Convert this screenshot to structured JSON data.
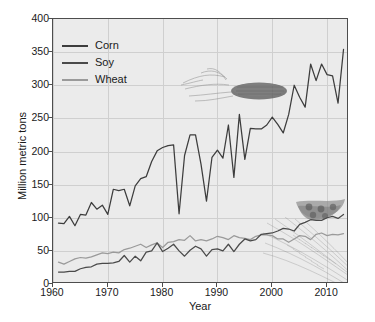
{
  "chart_data": {
    "type": "line",
    "title": "",
    "xlabel": "Year",
    "ylabel": "Million metric tons",
    "xlim": [
      1960,
      2014
    ],
    "ylim": [
      0,
      400
    ],
    "ytick_values": [
      0,
      50,
      100,
      150,
      200,
      250,
      300,
      350,
      400
    ],
    "ytick_labels": [
      "0",
      "50",
      "100",
      "150",
      "200",
      "250",
      "300",
      "350",
      "400"
    ],
    "xtick_values": [
      1960,
      1970,
      1980,
      1990,
      2000,
      2010
    ],
    "xtick_labels": [
      "1960",
      "1970",
      "1980",
      "1990",
      "2000",
      "2010"
    ],
    "grid": true,
    "legend_position": "top-left",
    "x": [
      1961,
      1962,
      1963,
      1964,
      1965,
      1966,
      1967,
      1968,
      1969,
      1970,
      1971,
      1972,
      1973,
      1974,
      1975,
      1976,
      1977,
      1978,
      1979,
      1980,
      1981,
      1982,
      1983,
      1984,
      1985,
      1986,
      1987,
      1988,
      1989,
      1990,
      1991,
      1992,
      1993,
      1994,
      1995,
      1996,
      1997,
      1998,
      1999,
      2000,
      2001,
      2002,
      2003,
      2004,
      2005,
      2006,
      2007,
      2008,
      2009,
      2010,
      2011,
      2012,
      2013
    ],
    "series": [
      {
        "name": "Corn",
        "color": "#3d3d3d",
        "values": [
          92,
          91,
          102,
          88,
          105,
          104,
          123,
          113,
          119,
          105,
          143,
          141,
          143,
          118,
          148,
          159,
          162,
          185,
          201,
          206,
          209,
          210,
          106,
          194,
          225,
          225,
          181,
          125,
          191,
          202,
          190,
          240,
          161,
          256,
          188,
          235,
          234,
          234,
          240,
          252,
          241,
          228,
          256,
          300,
          282,
          267,
          332,
          307,
          332,
          316,
          314,
          273,
          354
        ]
      },
      {
        "name": "Soy",
        "color": "#4a4a4a",
        "values": [
          18,
          18,
          19,
          19,
          23,
          25,
          26,
          30,
          31,
          31,
          32,
          34,
          43,
          33,
          42,
          35,
          48,
          50,
          62,
          49,
          54,
          60,
          50,
          42,
          51,
          57,
          53,
          42,
          52,
          53,
          50,
          60,
          49,
          60,
          68,
          65,
          67,
          75,
          76,
          77,
          80,
          84,
          83,
          80,
          90,
          93,
          97,
          96,
          96,
          100,
          102,
          99,
          105
        ]
      },
      {
        "name": "Wheat",
        "color": "#9a9a9a",
        "values": [
          33,
          30,
          34,
          38,
          40,
          39,
          41,
          44,
          47,
          46,
          48,
          47,
          52,
          54,
          57,
          60,
          55,
          59,
          62,
          55,
          63,
          64,
          67,
          66,
          73,
          65,
          67,
          65,
          68,
          72,
          70,
          67,
          73,
          70,
          69,
          67,
          72,
          74,
          74,
          73,
          68,
          68,
          63,
          68,
          73,
          72,
          67,
          75,
          77,
          73,
          75,
          74,
          76
        ]
      }
    ]
  },
  "legend": {
    "items": [
      {
        "label": "Corn",
        "color": "#3d3d3d"
      },
      {
        "label": "Soy",
        "color": "#4a4a4a"
      },
      {
        "label": "Wheat",
        "color": "#9a9a9a"
      }
    ]
  },
  "decorations": [
    {
      "name": "corn-cob-image",
      "label": "corn cob"
    },
    {
      "name": "soybean-pod-image",
      "label": "soybean pod"
    },
    {
      "name": "wheat-sheaf-image",
      "label": "wheat sheaf"
    }
  ],
  "colors": {
    "plot_background": "#ebebeb",
    "grid": "#cfcfcf",
    "axis": "#4d4d4d",
    "text": "#1a1a1a"
  }
}
